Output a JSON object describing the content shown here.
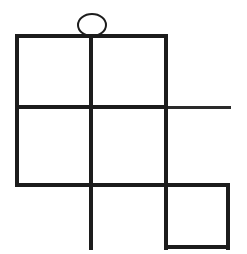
{
  "canvas": {
    "width": 247,
    "height": 254,
    "background": "#ffffff",
    "title": "abstract line figure"
  },
  "style": {
    "stroke_color": "#1c1c1c",
    "stroke_color_light": "#2a2a2a",
    "thick_width": 4,
    "thin_width": 3,
    "ellipse_width": 2,
    "line_cap": "butt"
  },
  "figure": {
    "ellipse": {
      "name": "head-ellipse",
      "cx": 92,
      "cy": 25,
      "rx": 14,
      "ry": 11,
      "fill": "none",
      "stroke_width": 2
    },
    "segments": [
      {
        "name": "top-horizontal-line",
        "orientation": "horizontal",
        "x1": 16,
        "y1": 36,
        "x2": 167,
        "y2": 36,
        "width": 4
      },
      {
        "name": "middle-horizontal-line",
        "orientation": "horizontal",
        "x1": 16,
        "y1": 107,
        "x2": 167,
        "y2": 107,
        "width": 4
      },
      {
        "name": "middle-horizontal-extension",
        "orientation": "horizontal",
        "x1": 167,
        "y1": 107,
        "x2": 231,
        "y2": 107,
        "width": 3
      },
      {
        "name": "bottom-horizontal-line",
        "orientation": "horizontal",
        "x1": 16,
        "y1": 185,
        "x2": 229,
        "y2": 185,
        "width": 4
      },
      {
        "name": "bottom-square-base-line",
        "orientation": "horizontal",
        "x1": 167,
        "y1": 247,
        "x2": 229,
        "y2": 247,
        "width": 4
      },
      {
        "name": "left-vertical-line",
        "orientation": "vertical",
        "x1": 17,
        "y1": 36,
        "x2": 17,
        "y2": 185,
        "width": 4
      },
      {
        "name": "center-vertical-line",
        "orientation": "vertical",
        "x1": 91,
        "y1": 36,
        "x2": 91,
        "y2": 248,
        "width": 4
      },
      {
        "name": "right-vertical-line",
        "orientation": "vertical",
        "x1": 166,
        "y1": 36,
        "x2": 166,
        "y2": 248,
        "width": 4
      },
      {
        "name": "far-right-vertical-line",
        "orientation": "vertical",
        "x1": 228,
        "y1": 185,
        "x2": 228,
        "y2": 248,
        "width": 4
      }
    ],
    "regions": [
      {
        "name": "cell-top-left",
        "x": 17,
        "y": 36,
        "w": 74,
        "h": 71
      },
      {
        "name": "cell-top-right",
        "x": 91,
        "y": 36,
        "w": 75,
        "h": 71
      },
      {
        "name": "cell-middle-left",
        "x": 17,
        "y": 107,
        "w": 74,
        "h": 78
      },
      {
        "name": "cell-middle-right",
        "x": 91,
        "y": 107,
        "w": 75,
        "h": 78
      },
      {
        "name": "cell-bottom-right",
        "x": 166,
        "y": 185,
        "w": 62,
        "h": 62
      }
    ]
  }
}
